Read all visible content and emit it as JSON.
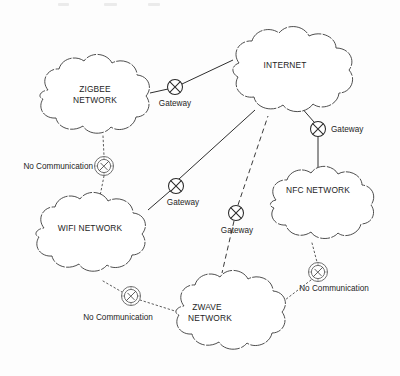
{
  "diagram": {
    "type": "network-topology-diagram",
    "title": "",
    "style": "hand-drawn scanned figure, black ink on white paper",
    "clouds": [
      {
        "id": "internet",
        "label": "INTERNET",
        "label_lines": [
          "INTERNET"
        ],
        "cx": 285,
        "cy": 78,
        "rx": 72,
        "ry": 44,
        "label_x": 285,
        "label_y": 68
      },
      {
        "id": "zigbee",
        "label": "ZIGBEE NETWORK",
        "label_lines": [
          "ZIGBEE",
          "NETWORK"
        ],
        "cx": 98,
        "cy": 98,
        "rx": 58,
        "ry": 40,
        "label_x": 95,
        "label_y": 92
      },
      {
        "id": "wifi",
        "label": "WIFI NETWORK",
        "label_lines": [
          "WIFI NETWORK"
        ],
        "cx": 92,
        "cy": 235,
        "rx": 58,
        "ry": 40,
        "label_x": 90,
        "label_y": 228
      },
      {
        "id": "zwave",
        "label": "ZWAVE NETWORK",
        "label_lines": [
          "ZWAVE",
          "NETWORK"
        ],
        "cx": 232,
        "cy": 313,
        "rx": 58,
        "ry": 40,
        "label_x": 207,
        "label_y": 307
      },
      {
        "id": "nfc",
        "label": "NFC NETWORK",
        "label_lines": [
          "NFC NETWORK"
        ],
        "cx": 322,
        "cy": 205,
        "rx": 58,
        "ry": 38,
        "label_x": 310,
        "label_y": 190
      }
    ],
    "gateways": [
      {
        "id": "gateway-zigbee",
        "label": "Gateway",
        "x": 175,
        "y": 87,
        "r": 7.5,
        "label_x": 175,
        "label_y": 106,
        "label_anchor": "middle",
        "connects": [
          "zigbee",
          "internet"
        ]
      },
      {
        "id": "gateway-wifi",
        "label": "Gateway",
        "x": 176,
        "y": 186,
        "r": 7.5,
        "label_x": 183,
        "label_y": 205,
        "label_anchor": "middle",
        "connects": [
          "wifi",
          "internet"
        ]
      },
      {
        "id": "gateway-zwave",
        "label": "Gateway",
        "x": 236,
        "y": 213,
        "r": 7.5,
        "label_x": 237,
        "label_y": 233,
        "label_anchor": "middle",
        "connects": [
          "zwave",
          "internet"
        ]
      },
      {
        "id": "gateway-nfc",
        "label": "Gateway",
        "x": 318,
        "y": 129,
        "r": 7.5,
        "label_x": 331,
        "label_y": 132,
        "label_anchor": "start",
        "connects": [
          "nfc",
          "internet"
        ]
      }
    ],
    "no_communication_markers": [
      {
        "id": "nocomm-zigbee-wifi",
        "label": "No Communication",
        "x": 104,
        "y": 166,
        "r": 9.5,
        "label_x": 93,
        "label_y": 163,
        "label_anchor": "end",
        "between": [
          "zigbee",
          "wifi"
        ]
      },
      {
        "id": "nocomm-wifi-zwave",
        "label": "No Communication",
        "x": 131,
        "y": 296,
        "r": 9.5,
        "label_x": 120,
        "label_y": 320,
        "label_anchor": "middle",
        "between": [
          "wifi",
          "zwave"
        ]
      },
      {
        "id": "nocomm-nfc-zwave",
        "label": "No Communication",
        "x": 318,
        "y": 272,
        "r": 9.5,
        "label_x": 331,
        "label_y": 291,
        "label_anchor": "middle",
        "between": [
          "nfc",
          "zwave"
        ]
      }
    ],
    "links": [
      {
        "id": "link-zigbee-gateway",
        "style": "solid",
        "from": "zigbee",
        "to": "gateway-zigbee"
      },
      {
        "id": "link-gateway-internet-zigbee",
        "style": "solid",
        "from": "gateway-zigbee",
        "to": "internet"
      },
      {
        "id": "link-wifi-gateway",
        "style": "solid",
        "from": "wifi",
        "to": "gateway-wifi"
      },
      {
        "id": "link-gateway-internet-wifi",
        "style": "solid",
        "from": "gateway-wifi",
        "to": "internet"
      },
      {
        "id": "link-zwave-gateway",
        "style": "dashed",
        "from": "zwave",
        "to": "gateway-zwave"
      },
      {
        "id": "link-gateway-internet-zwave",
        "style": "dashed",
        "from": "gateway-zwave",
        "to": "internet"
      },
      {
        "id": "link-nfc-gateway",
        "style": "solid",
        "from": "nfc",
        "to": "gateway-nfc"
      },
      {
        "id": "link-gateway-internet-nfc",
        "style": "solid",
        "from": "gateway-nfc",
        "to": "internet"
      },
      {
        "id": "link-zigbee-nocomm",
        "style": "dotted",
        "from": "zigbee",
        "to": "nocomm-zigbee-wifi"
      },
      {
        "id": "link-nocomm-wifi",
        "style": "dotted",
        "from": "nocomm-zigbee-wifi",
        "to": "wifi"
      },
      {
        "id": "link-wifi-nocomm2",
        "style": "dotted",
        "from": "wifi",
        "to": "nocomm-wifi-zwave"
      },
      {
        "id": "link-nocomm2-zwave",
        "style": "dotted",
        "from": "nocomm-wifi-zwave",
        "to": "zwave"
      },
      {
        "id": "link-nfc-nocomm3",
        "style": "dotted",
        "from": "nfc",
        "to": "nocomm-nfc-zwave"
      },
      {
        "id": "link-nocomm3-zwave",
        "style": "dotted",
        "from": "nocomm-nfc-zwave",
        "to": "zwave"
      }
    ]
  }
}
